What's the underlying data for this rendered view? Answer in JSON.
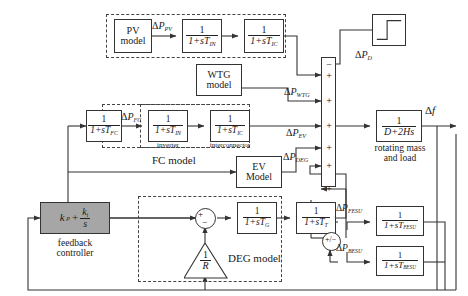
{
  "figure": {
    "kind": "control-block-diagram"
  },
  "blocks": {
    "pv_model": {
      "name": "pv-model-block",
      "line1": "PV",
      "line2": "model"
    },
    "pv_inverter": {
      "name": "pv-inverter-block",
      "num": "1",
      "den_pre": "1+s",
      "den_var": "T",
      "den_sub": "IN"
    },
    "pv_interconnect": {
      "name": "pv-interconnector-block",
      "num": "1",
      "den_pre": "1+s",
      "den_var": "T",
      "den_sub": "IC"
    },
    "wtg_model": {
      "name": "wtg-model-block",
      "line1": "WTG",
      "line2": "model"
    },
    "fc_lag": {
      "name": "fc-lag-block",
      "num": "1",
      "den_pre": "1+s",
      "den_var": "T",
      "den_sub": "FC"
    },
    "fc_inverter": {
      "name": "fc-inverter-block",
      "num": "1",
      "den_pre": "1+s",
      "den_var": "T",
      "den_sub": "IN",
      "caption": "inverter"
    },
    "fc_interconnect": {
      "name": "fc-interconnector-block",
      "num": "1",
      "den_pre": "1+s",
      "den_var": "T",
      "den_sub": "IC",
      "caption": "interconnector"
    },
    "ev_model": {
      "name": "ev-model-block",
      "line1": "EV",
      "line2": "Model"
    },
    "deg_governor": {
      "name": "deg-governor-block",
      "num": "1",
      "den_pre": "1+s",
      "den_var": "T",
      "den_sub": "G"
    },
    "deg_turbine": {
      "name": "deg-turbine-block",
      "num": "1",
      "den_pre": "1+s",
      "den_var": "T",
      "den_sub": "T"
    },
    "droop": {
      "name": "droop-gain-triangle",
      "num": "1",
      "den": "R"
    },
    "controller": {
      "name": "feedback-controller-block",
      "kp": "k",
      "kp_sub": "p",
      "plus": "+",
      "ki": "k",
      "ki_sub": "i",
      "ki_den": "s",
      "caption_l1": "feedback",
      "caption_l2": "controller"
    },
    "rotating_mass": {
      "name": "rotating-mass-block",
      "num": "1",
      "den": "D+2Hs",
      "caption_l1": "rotating mass",
      "caption_l2": "and load"
    },
    "fesu": {
      "name": "fesu-block",
      "num": "1",
      "den_pre": "1+s",
      "den_var": "T",
      "den_sub": "FESU"
    },
    "besu": {
      "name": "besu-block",
      "num": "1",
      "den_pre": "1+s",
      "den_var": "T",
      "den_sub": "BESU"
    },
    "load_step": {
      "name": "load-disturbance-step-block",
      "icon": "step-input-icon"
    }
  },
  "group_labels": {
    "pv_group": {
      "name": "pv-model-group",
      "label": ""
    },
    "fc_group": {
      "name": "fc-model-group",
      "label": "FC model"
    },
    "deg_group": {
      "name": "deg-model-group",
      "label": "DEG model"
    }
  },
  "signals": {
    "d_p_pv": {
      "name": "signal-delta-p-pv",
      "delta": "Δ",
      "p": "P",
      "sub": "PV"
    },
    "d_p_fc": {
      "name": "signal-delta-p-fc",
      "delta": "Δ",
      "p": "P",
      "sub": "FC"
    },
    "d_p_wtg": {
      "name": "signal-delta-p-wtg",
      "delta": "Δ",
      "p": "P",
      "sub": "WTG"
    },
    "d_p_ev": {
      "name": "signal-delta-p-ev",
      "delta": "Δ",
      "p": "P",
      "sub": "EV"
    },
    "d_p_deg": {
      "name": "signal-delta-p-deg",
      "delta": "Δ",
      "p": "P",
      "sub": "DEG"
    },
    "d_p_d": {
      "name": "signal-delta-p-d",
      "delta": "Δ",
      "p": "P",
      "sub": "D"
    },
    "d_p_fesu": {
      "name": "signal-delta-p-fesu",
      "delta": "Δ",
      "p": "P",
      "sub": "FESU"
    },
    "d_p_besu": {
      "name": "signal-delta-p-besu",
      "delta": "Δ",
      "p": "P",
      "sub": "BESU"
    },
    "d_f": {
      "name": "signal-delta-f",
      "delta": "Δ",
      "f": "f"
    }
  },
  "summing_bar": {
    "name": "main-summing-junction",
    "signs": [
      "−",
      "+",
      "+",
      "+",
      "+",
      "+",
      "+"
    ]
  },
  "storage_junction": {
    "name": "storage-splitter-junction",
    "label": "+/−"
  },
  "deg_junction": {
    "name": "deg-summing-junction",
    "plus": "+",
    "minus": "−"
  },
  "colors": {
    "line": "#333333",
    "block_fill": "#ffffff",
    "controller_fill": "#a6a6a6",
    "dashed_border": "#444444",
    "text": "#1a1a1a"
  }
}
